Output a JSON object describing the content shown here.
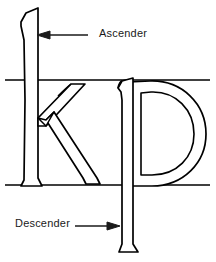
{
  "diagram": {
    "type": "typography-anatomy-diagram",
    "background_color": "#ffffff",
    "stroke_color": "#000000",
    "text_color": "#1a1a1a",
    "glyphs": [
      {
        "name": "letter-k",
        "character": "k"
      },
      {
        "name": "letter-p",
        "character": "p"
      }
    ],
    "guidelines": [
      {
        "name": "x-height-line",
        "label": "",
        "y": 80
      },
      {
        "name": "baseline",
        "label": "",
        "y": 185
      }
    ],
    "annotations": [
      {
        "id": "ascender",
        "label": "Ascender",
        "arrow_direction": "left",
        "target": "letter-k-ascender-stem"
      },
      {
        "id": "descender",
        "label": "Descender",
        "arrow_direction": "right",
        "target": "letter-p-descender-stem"
      }
    ]
  }
}
